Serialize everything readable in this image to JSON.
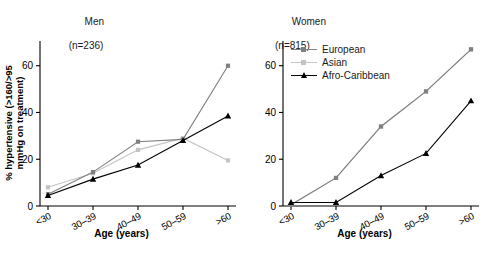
{
  "figure": {
    "panels": [
      {
        "key": "men",
        "title_line1": "Men",
        "title_line2": "(n=236)",
        "ylabel_line1": "% hypertensive (>160/>95",
        "ylabel_line2": "mmHg on treatment)",
        "xlabel": "Age (years)"
      },
      {
        "key": "women",
        "title_line1": "Women",
        "title_line2": "(n=815)",
        "ylabel_line1": "",
        "ylabel_line2": "",
        "xlabel": "Age (years)"
      }
    ],
    "legend": {
      "items": [
        {
          "label": "European",
          "color": "#808080",
          "marker": "square"
        },
        {
          "label": "Asian",
          "color": "#c4c4c4",
          "marker": "square"
        },
        {
          "label": "Afro-Caribbean",
          "color": "#000000",
          "marker": "triangle"
        }
      ]
    },
    "yticks": [
      "0",
      "20",
      "40",
      "60"
    ],
    "xticks": [
      "<30",
      "30–39",
      "40–49",
      "50–59",
      ">60"
    ]
  },
  "chart_data": [
    {
      "type": "line",
      "title": "Men (n=236)",
      "xlabel": "Age (years)",
      "ylabel": "% hypertensive (>160/>95 mmHg on treatment)",
      "categories": [
        "<30",
        "30–39",
        "40–49",
        "50–59",
        ">60"
      ],
      "ylim": [
        0,
        68
      ],
      "yticks": [
        0,
        20,
        40,
        60
      ],
      "grid": false,
      "legend_position": "none",
      "series": [
        {
          "name": "European",
          "color": "#808080",
          "marker": "square",
          "values": [
            5.0,
            14.5,
            27.5,
            28.5,
            60.0
          ]
        },
        {
          "name": "Asian",
          "color": "#c4c4c4",
          "marker": "square",
          "values": [
            8.0,
            14.0,
            24.0,
            29.0,
            19.5
          ]
        },
        {
          "name": "Afro-Caribbean",
          "color": "#000000",
          "marker": "triangle",
          "values": [
            4.5,
            11.5,
            17.5,
            28.0,
            38.5
          ]
        }
      ]
    },
    {
      "type": "line",
      "title": "Women (n=815)",
      "xlabel": "Age (years)",
      "ylabel": "",
      "categories": [
        "<30",
        "30–39",
        "40–49",
        "50–59",
        ">60"
      ],
      "ylim": [
        0,
        68
      ],
      "yticks": [
        0,
        20,
        40,
        60
      ],
      "grid": false,
      "legend_position": "upper-left",
      "series": [
        {
          "name": "European",
          "color": "#808080",
          "marker": "square",
          "values": [
            0.5,
            12.0,
            34.0,
            49.0,
            67.0
          ]
        },
        {
          "name": "Asian",
          "color": "#c4c4c4",
          "marker": "square",
          "values": [
            0.5,
            12.0,
            34.0,
            49.0,
            67.0
          ]
        },
        {
          "name": "Afro-Caribbean",
          "color": "#000000",
          "marker": "triangle",
          "values": [
            1.5,
            1.5,
            13.0,
            22.5,
            45.0
          ]
        }
      ]
    }
  ]
}
